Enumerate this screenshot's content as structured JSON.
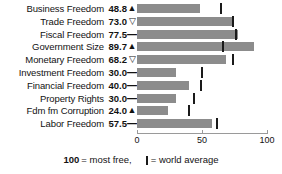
{
  "chart_data": {
    "type": "bar",
    "title": "",
    "xlabel": "",
    "ylabel": "",
    "xlim": [
      0,
      100
    ],
    "grid": false,
    "orientation": "horizontal",
    "categories": [
      "Business Freedom",
      "Trade Freedom",
      "Fiscal Freedom",
      "Government Size",
      "Monetary Freedom",
      "Investment Freedom",
      "Financial Freedom",
      "Property Rights",
      "Fdm fm Corruption",
      "Labor Freedom"
    ],
    "values": [
      48.8,
      73.0,
      77.5,
      89.7,
      68.2,
      30.0,
      40.0,
      30.0,
      24.0,
      57.5
    ],
    "value_labels": [
      "48.8",
      "73.0",
      "77.5",
      "89.7",
      "68.2",
      "30.0",
      "40.0",
      "30.0",
      "24.0",
      "57.5"
    ],
    "trend_markers": [
      "up",
      "down",
      "flat",
      "up",
      "down",
      "flat",
      "flat",
      "flat",
      "up",
      "flat"
    ],
    "world_average": [
      64.5,
      74.0,
      76.0,
      66.0,
      74.0,
      50.0,
      49.0,
      44.0,
      40.0,
      61.5
    ],
    "axis_ticks": [
      0,
      50,
      100
    ],
    "axis_tick_labels": [
      "0",
      "50",
      "100"
    ],
    "bar_color": "#8c8c8c",
    "tick_color": "#1a1a1a"
  },
  "legend": {
    "max_value": "100",
    "max_text": "= most free,",
    "average_text": "= world average"
  },
  "icons": {
    "up": "▲",
    "down": "▽",
    "flat": "—"
  }
}
